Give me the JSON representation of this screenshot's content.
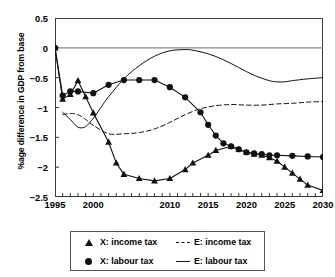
{
  "chart_data": {
    "type": "line",
    "title": "",
    "xlabel": "",
    "ylabel": "%age difference in GDP from base",
    "xlim": [
      1995,
      2030
    ],
    "ylim": [
      -2.5,
      0.5
    ],
    "grid": false,
    "zero_line": true,
    "legend_position": "below",
    "y_ticks": [
      0.5,
      0,
      -0.5,
      -1,
      -1.5,
      -2,
      -2.5
    ],
    "y_tick_labels": [
      "0.5",
      "0",
      "−0.5",
      "−1",
      "−1.5",
      "−2",
      "−2.5"
    ],
    "x_ticks": [
      1995,
      1996,
      1997,
      1998,
      1999,
      2000,
      2001,
      2002,
      2003,
      2004,
      2005,
      2006,
      2007,
      2008,
      2009,
      2010,
      2011,
      2012,
      2013,
      2014,
      2015,
      2016,
      2017,
      2018,
      2019,
      2020,
      2021,
      2022,
      2023,
      2024,
      2025,
      2026,
      2027,
      2028,
      2029,
      2030
    ],
    "x_tick_labels": [
      "1995",
      "2000",
      "2010",
      "2015",
      "2020",
      "2025",
      "2030"
    ],
    "x_tick_label_years": [
      1995,
      2000,
      2010,
      2015,
      2020,
      2025,
      2030
    ],
    "series": [
      {
        "name": "X: income tax",
        "style": "line-marker",
        "marker": "triangle",
        "color": "#111111",
        "x": [
          1995,
          1996,
          1997,
          1998,
          1999,
          2000,
          2002,
          2003,
          2004,
          2006,
          2008,
          2010,
          2012,
          2013,
          2015,
          2016,
          2018,
          2019,
          2020,
          2021,
          2022,
          2023,
          2024,
          2025,
          2026,
          2027,
          2028,
          2030
        ],
        "values": [
          0.0,
          -0.86,
          -0.78,
          -0.55,
          -0.82,
          -1.09,
          -1.58,
          -1.93,
          -2.12,
          -2.19,
          -2.23,
          -2.19,
          -2.04,
          -1.93,
          -1.8,
          -1.72,
          -1.65,
          -1.7,
          -1.75,
          -1.78,
          -1.8,
          -1.84,
          -1.9,
          -2.0,
          -2.1,
          -2.2,
          -2.3,
          -2.39
        ]
      },
      {
        "name": "X: labour tax",
        "style": "line-marker",
        "marker": "circle",
        "color": "#111111",
        "x": [
          1995,
          1996,
          1997,
          1998,
          2000,
          2002,
          2004,
          2006,
          2008,
          2010,
          2012,
          2014,
          2015,
          2016,
          2017,
          2018,
          2019,
          2020,
          2021,
          2022,
          2023,
          2024,
          2026,
          2028,
          2030
        ],
        "values": [
          0.0,
          -0.8,
          -0.73,
          -0.73,
          -0.76,
          -0.62,
          -0.54,
          -0.54,
          -0.54,
          -0.66,
          -0.83,
          -1.08,
          -1.29,
          -1.47,
          -1.6,
          -1.65,
          -1.7,
          -1.75,
          -1.77,
          -1.78,
          -1.8,
          -1.8,
          -1.81,
          -1.82,
          -1.83
        ]
      },
      {
        "name": "E: income tax",
        "style": "dashed",
        "marker": "none",
        "color": "#111111",
        "x": [
          1996,
          1997,
          1998,
          1999,
          2000,
          2002,
          2004,
          2006,
          2008,
          2010,
          2012,
          2014,
          2016,
          2018,
          2020,
          2022,
          2024,
          2026,
          2028,
          2030
        ],
        "values": [
          -1.12,
          -1.1,
          -1.12,
          -1.2,
          -1.3,
          -1.44,
          -1.44,
          -1.42,
          -1.36,
          -1.25,
          -1.12,
          -1.02,
          -0.97,
          -0.95,
          -0.96,
          -0.96,
          -0.94,
          -0.93,
          -0.91,
          -0.9
        ]
      },
      {
        "name": "E: labour tax",
        "style": "solid",
        "marker": "none",
        "color": "#111111",
        "x": [
          1996,
          1997,
          1998,
          1999,
          2000,
          2001,
          2002,
          2004,
          2006,
          2008,
          2010,
          2012,
          2013,
          2015,
          2017,
          2019,
          2021,
          2023,
          2024,
          2025,
          2026,
          2028,
          2030
        ],
        "values": [
          -1.08,
          -1.2,
          -1.33,
          -1.32,
          -1.18,
          -1.0,
          -0.82,
          -0.52,
          -0.3,
          -0.14,
          -0.05,
          -0.03,
          -0.04,
          -0.1,
          -0.2,
          -0.33,
          -0.46,
          -0.55,
          -0.57,
          -0.57,
          -0.55,
          -0.52,
          -0.5
        ]
      }
    ]
  },
  "axis": {
    "ylabel": "%age difference in GDP from base"
  },
  "legend": {
    "items": [
      {
        "key": "triangle",
        "label": "X: income tax"
      },
      {
        "key": "dashed",
        "label": "E: income tax"
      },
      {
        "key": "circle",
        "label": "X: labour tax"
      },
      {
        "key": "solid",
        "label": "E: labour tax"
      }
    ]
  }
}
